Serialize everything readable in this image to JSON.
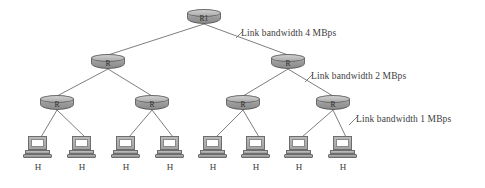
{
  "diagram": {
    "type": "network-tree",
    "colors": {
      "background": "#ffffff",
      "node_fill": "#9a9a9a",
      "node_stroke": "#6a6a6a",
      "link_stroke": "#6f6f6f",
      "text": "#3b3b3b"
    },
    "nodes": {
      "root": {
        "id": "root",
        "label": "R1",
        "kind": "router",
        "x": 204,
        "y": 17
      },
      "level2": [
        {
          "id": "r2-1",
          "label": "R",
          "kind": "router",
          "x": 108,
          "y": 62
        },
        {
          "id": "r2-2",
          "label": "R",
          "kind": "router",
          "x": 288,
          "y": 62
        }
      ],
      "level3": [
        {
          "id": "r3-1",
          "label": "R",
          "kind": "router",
          "x": 57,
          "y": 103
        },
        {
          "id": "r3-2",
          "label": "R",
          "kind": "router",
          "x": 152,
          "y": 103
        },
        {
          "id": "r3-3",
          "label": "R",
          "kind": "router",
          "x": 243,
          "y": 103
        },
        {
          "id": "r3-4",
          "label": "R",
          "kind": "router",
          "x": 333,
          "y": 103
        }
      ],
      "hosts": [
        {
          "id": "h1",
          "label": "H",
          "kind": "host",
          "x": 38,
          "y": 136
        },
        {
          "id": "h2",
          "label": "H",
          "kind": "host",
          "x": 82,
          "y": 136
        },
        {
          "id": "h3",
          "label": "H",
          "kind": "host",
          "x": 126,
          "y": 136
        },
        {
          "id": "h4",
          "label": "H",
          "kind": "host",
          "x": 170,
          "y": 136
        },
        {
          "id": "h5",
          "label": "H",
          "kind": "host",
          "x": 213,
          "y": 136
        },
        {
          "id": "h6",
          "label": "H",
          "kind": "host",
          "x": 256,
          "y": 136
        },
        {
          "id": "h7",
          "label": "H",
          "kind": "host",
          "x": 299,
          "y": 136
        },
        {
          "id": "h8",
          "label": "H",
          "kind": "host",
          "x": 343,
          "y": 136
        }
      ]
    },
    "links": [
      {
        "from": "root",
        "to": "r2-1",
        "tier": 1
      },
      {
        "from": "root",
        "to": "r2-2",
        "tier": 1
      },
      {
        "from": "r2-1",
        "to": "r3-1",
        "tier": 2
      },
      {
        "from": "r2-1",
        "to": "r3-2",
        "tier": 2
      },
      {
        "from": "r2-2",
        "to": "r3-3",
        "tier": 2
      },
      {
        "from": "r2-2",
        "to": "r3-4",
        "tier": 2
      },
      {
        "from": "r3-1",
        "to": "h1",
        "tier": 3
      },
      {
        "from": "r3-1",
        "to": "h2",
        "tier": 3
      },
      {
        "from": "r3-2",
        "to": "h3",
        "tier": 3
      },
      {
        "from": "r3-2",
        "to": "h4",
        "tier": 3
      },
      {
        "from": "r3-3",
        "to": "h5",
        "tier": 3
      },
      {
        "from": "r3-3",
        "to": "h6",
        "tier": 3
      },
      {
        "from": "r3-4",
        "to": "h7",
        "tier": 3
      },
      {
        "from": "r3-4",
        "to": "h8",
        "tier": 3
      }
    ],
    "annotations": [
      {
        "id": "bw-tier-1",
        "text": "Link bandwidth 4 MBps",
        "bandwidth_value": 4,
        "bandwidth_unit": "MBps",
        "x": 241,
        "y": 28,
        "leader": {
          "x1": 236,
          "y1": 38,
          "x2": 243,
          "y2": 31
        }
      },
      {
        "id": "bw-tier-2",
        "text": "Link bandwidth 2 MBps",
        "bandwidth_value": 2,
        "bandwidth_unit": "MBps",
        "x": 311,
        "y": 71,
        "leader": {
          "x1": 305,
          "y1": 82,
          "x2": 313,
          "y2": 74
        }
      },
      {
        "id": "bw-tier-3",
        "text": "Link bandwidth 1 MBps",
        "bandwidth_value": 1,
        "bandwidth_unit": "MBps",
        "x": 356,
        "y": 114,
        "leader": {
          "x1": 349,
          "y1": 125,
          "x2": 357,
          "y2": 117
        }
      }
    ]
  }
}
